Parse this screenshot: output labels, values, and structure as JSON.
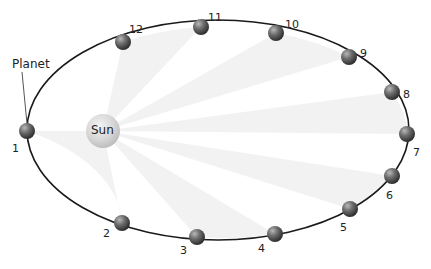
{
  "diagram": {
    "planet_label": "Planet",
    "sun_label": "Sun",
    "orbit": {
      "cx": 218,
      "cy": 130,
      "rx": 191,
      "ry": 110,
      "stroke": "#1a1a1a"
    },
    "sun": {
      "cx": 103,
      "cy": 131,
      "r": 17,
      "color": "#cfcfcf"
    },
    "planets": [
      {
        "n": "1",
        "x": 27,
        "y": 131,
        "lx": 12,
        "ly": 143
      },
      {
        "n": "2",
        "x": 122,
        "y": 223,
        "lx": 103,
        "ly": 228
      },
      {
        "n": "3",
        "x": 197,
        "y": 237,
        "lx": 180,
        "ly": 245
      },
      {
        "n": "4",
        "x": 275,
        "y": 234,
        "lx": 258,
        "ly": 243
      },
      {
        "n": "5",
        "x": 350,
        "y": 209,
        "lx": 340,
        "ly": 222
      },
      {
        "n": "6",
        "x": 392,
        "y": 176,
        "lx": 386,
        "ly": 190
      },
      {
        "n": "7",
        "x": 407,
        "y": 134,
        "lx": 413,
        "ly": 147
      },
      {
        "n": "8",
        "x": 392,
        "y": 92,
        "lx": 403,
        "ly": 89
      },
      {
        "n": "9",
        "x": 349,
        "y": 57,
        "lx": 360,
        "ly": 48
      },
      {
        "n": "10",
        "x": 276,
        "y": 33,
        "lx": 285,
        "ly": 19
      },
      {
        "n": "11",
        "x": 201,
        "y": 27,
        "lx": 208,
        "ly": 12
      },
      {
        "n": "12",
        "x": 123,
        "y": 42,
        "lx": 129,
        "ly": 24
      }
    ],
    "sweeps": [
      {
        "from": "12",
        "to": "11"
      },
      {
        "from": "10",
        "to": "9"
      },
      {
        "from": "8",
        "to": "7"
      },
      {
        "from": "6",
        "to": "5"
      },
      {
        "from": "4",
        "to": "3"
      },
      {
        "from": "2",
        "to": "1"
      }
    ]
  }
}
